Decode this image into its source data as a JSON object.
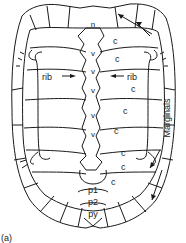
{
  "figure": {
    "panel_label": "(a)",
    "labels": {
      "n": "n",
      "c": "c",
      "v": "v",
      "rib_left": "rib",
      "rib_right": "rib",
      "marginals": "Marginals",
      "p1": "p1",
      "p2": "p2",
      "py": "py"
    },
    "costal_labels": [
      "c",
      "c",
      "c",
      "c",
      "c",
      "c",
      "c",
      "c"
    ],
    "vertebra_labels": [
      "v",
      "v",
      "v",
      "v",
      "v"
    ]
  },
  "colors": {
    "line": "#1a1a1a",
    "background": "#ffffff"
  }
}
